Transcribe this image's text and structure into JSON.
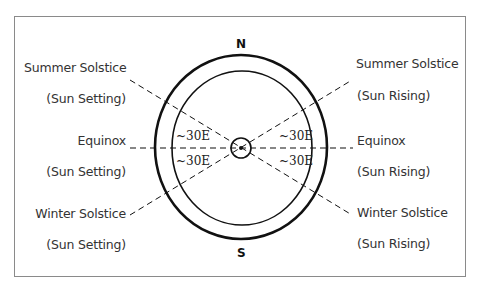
{
  "diagram": {
    "compass": {
      "north": "N",
      "south": "S"
    },
    "left_labels": [
      {
        "title": "Summer Solstice",
        "subtitle": "(Sun Setting)"
      },
      {
        "title": "Equinox",
        "subtitle": "(Sun Setting)"
      },
      {
        "title": "Winter Solstice",
        "subtitle": "(Sun Setting)"
      }
    ],
    "right_labels": [
      {
        "title": "Summer Solstice",
        "subtitle": "(Sun Rising)"
      },
      {
        "title": "Equinox",
        "subtitle": "(Sun Rising)"
      },
      {
        "title": "Winter Solstice",
        "subtitle": "(Sun Rising)"
      }
    ],
    "angle_labels": {
      "upper_left": "~30E",
      "lower_left": "~30E",
      "upper_right": "~30E",
      "lower_right": "~30E"
    },
    "colors": {
      "line": "#111111",
      "frame": "#8a8a8a",
      "text": "#333333"
    }
  }
}
